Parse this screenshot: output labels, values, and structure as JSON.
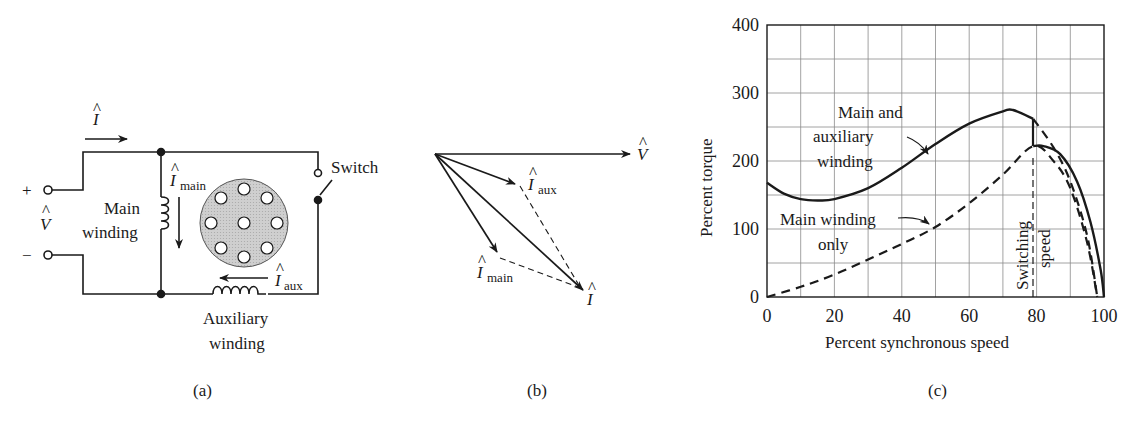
{
  "figure": {
    "panels": [
      {
        "id": "a",
        "caption": "(a)",
        "type": "circuit",
        "labels": {
          "current_total": "I",
          "voltage": "V",
          "plus": "+",
          "minus": "−",
          "main_current": "I",
          "main_current_sub": "main",
          "main_winding_line1": "Main",
          "main_winding_line2": "winding",
          "aux_current": "I",
          "aux_current_sub": "aux",
          "aux_winding_line1": "Auxiliary",
          "aux_winding_line2": "winding",
          "switch": "Switch"
        }
      },
      {
        "id": "b",
        "caption": "(b)",
        "type": "phasor",
        "labels": {
          "V": "V",
          "I_aux": "I",
          "I_aux_sub": "aux",
          "I_main": "I",
          "I_main_sub": "main",
          "I_total": "I"
        }
      },
      {
        "id": "c",
        "caption": "(c)",
        "type": "chart"
      }
    ]
  },
  "chart_data": {
    "type": "line",
    "title": "",
    "xlabel": "Percent synchronous speed",
    "ylabel": "Percent torque",
    "xlim": [
      0,
      100
    ],
    "ylim": [
      0,
      400
    ],
    "xticks": [
      0,
      20,
      40,
      60,
      80,
      100
    ],
    "yticks": [
      0,
      100,
      200,
      300,
      400
    ],
    "grid": true,
    "grid_step": {
      "x": 10,
      "y": 50
    },
    "series": [
      {
        "name": "Main and auxiliary winding",
        "style": "solid",
        "x": [
          0,
          5,
          10,
          15,
          20,
          30,
          40,
          50,
          60,
          70,
          73,
          79
        ],
        "y": [
          168,
          152,
          144,
          142,
          144,
          160,
          190,
          225,
          255,
          273,
          275,
          262
        ]
      },
      {
        "name": "Main winding only",
        "style": "dashed",
        "x": [
          0,
          10,
          20,
          30,
          40,
          50,
          60,
          70,
          79,
          85,
          90,
          95,
          98
        ],
        "y": [
          0,
          15,
          33,
          55,
          78,
          103,
          138,
          180,
          222,
          200,
          160,
          80,
          0
        ]
      },
      {
        "name": "Main and auxiliary winding (dashed continuation)",
        "style": "dashed",
        "x": [
          79,
          85,
          90,
          95,
          98
        ],
        "y": [
          262,
          220,
          170,
          90,
          0
        ]
      },
      {
        "name": "Main winding only (after switching)",
        "style": "solid",
        "x": [
          79,
          82,
          87,
          92,
          96,
          99,
          100
        ],
        "y": [
          222,
          222,
          210,
          170,
          110,
          40,
          0
        ]
      }
    ],
    "annotations": [
      {
        "text": "Main and auxiliary winding",
        "lines": [
          "Main and",
          "auxiliary",
          "winding"
        ]
      },
      {
        "text": "Main winding only",
        "lines": [
          "Main winding",
          "only"
        ]
      },
      {
        "text": "Switching speed",
        "lines": [
          "Switching",
          "speed"
        ],
        "x": 79
      }
    ]
  }
}
